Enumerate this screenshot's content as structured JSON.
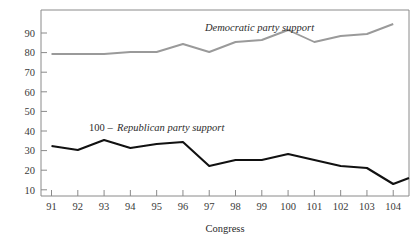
{
  "clipped_header": "Percent score",
  "chart_data": {
    "type": "line",
    "title": "",
    "xlabel": "Congress",
    "ylabel": "",
    "categories": [
      "91",
      "92",
      "93",
      "94",
      "95",
      "96",
      "97",
      "98",
      "99",
      "100",
      "101",
      "102",
      "103",
      "104"
    ],
    "x": [
      91,
      92,
      93,
      94,
      95,
      96,
      97,
      98,
      99,
      100,
      101,
      102,
      103,
      104
    ],
    "xlim": [
      90.6,
      104.6
    ],
    "ylim": [
      2,
      95
    ],
    "yticks": [
      10,
      20,
      30,
      40,
      50,
      60,
      70,
      80,
      90
    ],
    "grid": false,
    "legend": "inline-annotations",
    "series": [
      {
        "name": "Democratic party support",
        "color": "#9a9a9a",
        "values": [
          73,
          73,
          73,
          74,
          74,
          78,
          74,
          79,
          80,
          85,
          79,
          82,
          83,
          88
        ],
        "label": "Democratic party support",
        "label_x": 205,
        "label_y": 31
      },
      {
        "name": "100 - Republican party support",
        "color": "#111111",
        "values": [
          27,
          25,
          30,
          26,
          28,
          29,
          17,
          20,
          20,
          23,
          20,
          17,
          16,
          8
        ],
        "end_value": 11,
        "label_prefix": "100 – ",
        "label_italic": "Republican party support",
        "label_x": 89,
        "label_y": 131
      }
    ],
    "annotations": [
      {
        "text": "Congress",
        "role": "x-axis-title"
      }
    ]
  },
  "axis": {
    "y_tick_labels": [
      "90",
      "80",
      "70",
      "60",
      "50",
      "40",
      "30",
      "20",
      "10"
    ],
    "x_tick_labels": [
      "91",
      "92",
      "93",
      "94",
      "95",
      "96",
      "97",
      "98",
      "99",
      "100",
      "101",
      "102",
      "103",
      "104"
    ],
    "x_title": "Congress"
  },
  "colors": {
    "democratic_line": "#9a9a9a",
    "republican_line": "#111111",
    "frame": "#8a8a8a",
    "text": "#2b2b2b"
  }
}
